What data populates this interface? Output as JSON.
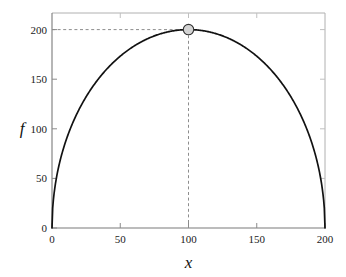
{
  "chart_data": {
    "type": "line",
    "title": "",
    "subtitle": "",
    "xlabel": "x",
    "ylabel": "f",
    "xlim": [
      0,
      200
    ],
    "ylim": [
      0,
      210
    ],
    "xticks": [
      0,
      50,
      100,
      150,
      200
    ],
    "yticks": [
      0,
      50,
      100,
      150,
      200
    ],
    "xtick_labels": [
      "0",
      "50",
      "100",
      "150",
      "200"
    ],
    "ytick_labels": [
      "0",
      "50",
      "100",
      "150",
      "200"
    ],
    "grid": false,
    "legend": null,
    "legend_position": "none",
    "series": [
      {
        "name": "f",
        "type": "line",
        "color": "#000000",
        "linewidth": 1.6,
        "style": "solid",
        "description": "semi-elliptical curve f(x) = 200*sqrt(1-((x-100)/100)^2)",
        "x": [
          0,
          2,
          5,
          10,
          15,
          20,
          25,
          30,
          35,
          40,
          45,
          50,
          55,
          60,
          65,
          70,
          75,
          80,
          85,
          90,
          95,
          100,
          105,
          110,
          115,
          120,
          125,
          130,
          135,
          140,
          145,
          150,
          155,
          160,
          165,
          170,
          175,
          180,
          185,
          190,
          195,
          198,
          200
        ],
        "y": [
          0,
          56,
          87.2,
          120,
          142.8,
          160,
          173.2,
          183.3,
          190.9,
          195.9,
          199,
          200,
          199,
          195.9,
          190.9,
          183.3,
          173.2,
          160,
          142.8,
          120,
          87.2,
          0,
          87.2,
          120,
          142.8,
          160,
          173.2,
          183.3,
          190.9,
          195.9,
          199,
          200,
          199,
          195.9,
          190.9,
          183.3,
          173.2,
          160,
          142.8,
          120,
          87.2,
          56,
          0
        ]
      }
    ],
    "annotations": [
      {
        "name": "maximum-marker",
        "kind": "point-marker",
        "x": 100,
        "y": 200,
        "marker": "circle",
        "fill_color": "#d3d3d3",
        "edge_color": "#333333",
        "radius": 5.5,
        "label": ""
      },
      {
        "name": "vertical-guide",
        "kind": "dashed-line",
        "orientation": "vertical",
        "value": 100,
        "from": 0,
        "to": 200,
        "color": "#808080",
        "style": "dashed"
      },
      {
        "name": "horizontal-guide",
        "kind": "dashed-line",
        "orientation": "horizontal",
        "value": 200,
        "from": 0,
        "to": 100,
        "color": "#808080",
        "style": "dashed"
      }
    ],
    "max_point": {
      "x": 100,
      "f": 200
    }
  },
  "axes": {
    "frame_color": "#9a9a9a",
    "axis_line_color": "#555555",
    "tick_color": "#808080",
    "ylabel": "f",
    "xlabel": "x"
  },
  "labels": {
    "y": {
      "t0": "0",
      "t1": "50",
      "t2": "100",
      "t3": "150",
      "t4": "200"
    },
    "x": {
      "t0": "0",
      "t1": "50",
      "t2": "100",
      "t3": "150",
      "t4": "200"
    }
  }
}
